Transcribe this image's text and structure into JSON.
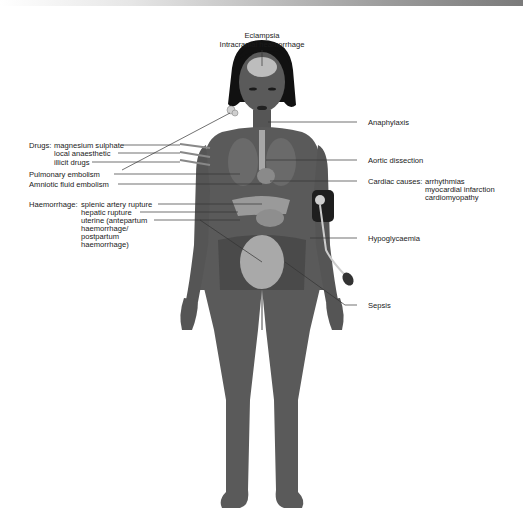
{
  "diagram": {
    "colors": {
      "skin": "#5a5a5a",
      "skin_dark": "#3e3e3e",
      "hair": "#111111",
      "organs": "#9a9a9a",
      "brain": "#bdbdbd",
      "leader_line": "#333333",
      "text": "#1a1a1a"
    },
    "labels": {
      "top": {
        "line1": "Eclampsia",
        "line2": "Intracranial heamorrhage"
      },
      "left": {
        "drugs_heading": "Drugs:",
        "drugs": [
          "magnesium sulphate",
          "local anaesthetic",
          "illicit drugs"
        ],
        "pulmonary_embolism": "Pulmonary embolism",
        "amniotic_fluid_embolism": "Amniotic fluid embolism",
        "haemorrhage_heading": "Haemorrhage:",
        "haemorrhage": [
          "splenic artery rupture",
          "hepatic rupture",
          "uterine (antepartum",
          "haemorrhage/",
          "postpartum",
          "haemorrhage)"
        ]
      },
      "right": {
        "anaphylaxis": "Anaphylaxis",
        "aortic_dissection": "Aortic dissection",
        "cardiac_heading": "Cardiac causes:",
        "cardiac": [
          "arrhythmias",
          "myocardial infarction",
          "cardiomyopathy"
        ],
        "hypoglycaemia": "Hypoglycaemia",
        "sepsis": "Sepsis"
      }
    }
  }
}
